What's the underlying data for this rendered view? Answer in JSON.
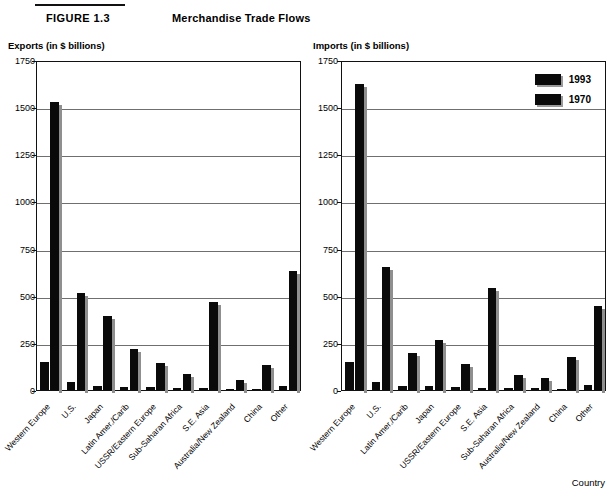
{
  "header": {
    "figure_label": "FIGURE 1.3",
    "title": "Merchandise Trade Flows"
  },
  "legend": {
    "items": [
      {
        "label": "1993",
        "color": "#0a0a0a"
      },
      {
        "label": "1970",
        "color": "#0a0a0a"
      }
    ]
  },
  "footer": {
    "country_label": "Country"
  },
  "chart_data": [
    {
      "type": "bar",
      "title": "Exports (in $ billions)",
      "ylabel": "Exports (in $ billions)",
      "xlabel": "",
      "ylim": [
        0,
        1750
      ],
      "yticks": [
        0,
        250,
        500,
        750,
        1000,
        1250,
        1500,
        1750
      ],
      "grid": true,
      "legend_position": "none",
      "categories": [
        "Western Europe",
        "U.S.",
        "Japan",
        "Latin Amer./Carib",
        "USSR/Eastern Europe",
        "Sub-Saharan Africa",
        "S.E. Asia",
        "Australia/New Zealand",
        "China",
        "Other"
      ],
      "series": [
        {
          "name": "1970",
          "values": [
            148,
            43,
            20,
            18,
            15,
            13,
            10,
            8,
            5,
            22
          ]
        },
        {
          "name": "1993",
          "values": [
            1530,
            512,
            391,
            216,
            141,
            85,
            469,
            55,
            135,
            632
          ]
        }
      ]
    },
    {
      "type": "bar",
      "title": "Imports (in $ billions)",
      "ylabel": "Imports (in $ billions)",
      "xlabel": "Country",
      "ylim": [
        0,
        1750
      ],
      "yticks": [
        0,
        250,
        500,
        750,
        1000,
        1250,
        1500,
        1750
      ],
      "grid": true,
      "legend_position": "top-right",
      "categories": [
        "Western Europe",
        "U.S.",
        "Latin Amer./Carib",
        "Japan",
        "USSR/Eastern Europe",
        "S.E. Asia",
        "Sub-Saharan Africa",
        "Australia/New Zealand",
        "China",
        "Other"
      ],
      "series": [
        {
          "name": "1970",
          "values": [
            151,
            45,
            21,
            19,
            17,
            12,
            10,
            9,
            6,
            24
          ]
        },
        {
          "name": "1993",
          "values": [
            1622,
            650,
            196,
            264,
            140,
            541,
            82,
            62,
            175,
            447
          ]
        }
      ]
    }
  ]
}
